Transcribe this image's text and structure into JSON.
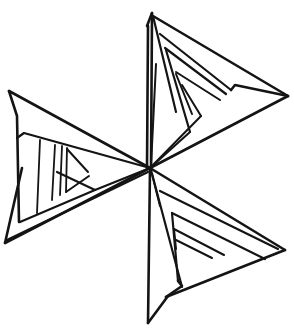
{
  "document": {
    "title": "Pinwheel Star Line Drawing",
    "kind": "line-drawing",
    "description": "Hand-drawn six-bladed pinwheel star composed of thin triangular blades radiating from a common center point, each blade filled with nested parallel line detail.",
    "width": 294,
    "height": 336
  },
  "style": {
    "background_color": "#ffffff",
    "stroke_color": "#141414",
    "stroke_width_outer": 2.6,
    "stroke_width_inner": 2.0
  },
  "figure": {
    "name": "pinwheel-star",
    "center": {
      "x": 150,
      "y": 168
    },
    "blade_count": 6,
    "tips": [
      {
        "name": "top-tip",
        "x": 152,
        "y": 13
      },
      {
        "name": "upper-right-tip",
        "x": 288,
        "y": 96
      },
      {
        "name": "lower-right-tip",
        "x": 285,
        "y": 250
      },
      {
        "name": "bottom-tip",
        "x": 148,
        "y": 323
      },
      {
        "name": "lower-left-tip",
        "x": 5,
        "y": 243
      },
      {
        "name": "upper-left-tip",
        "x": 9,
        "y": 91
      }
    ],
    "blades": [
      {
        "name": "blade-top",
        "label": "Top spike",
        "outline": "152,13 150,168 147,168 148,30",
        "detail_lines": [
          "152,13 172,168",
          "155,60 150,168"
        ]
      },
      {
        "name": "blade-upper-right",
        "label": "Upper-right blade",
        "outline": "153,16 288,96 234,86 150,168",
        "detail_lines": [
          "160,32 275,92",
          "171,57 233,87",
          "176,70 221,99",
          "182,83 204,110"
        ]
      },
      {
        "name": "blade-lower-right",
        "label": "Lower-right blade",
        "outline": "150,168 285,250 230,249 165,300",
        "detail_lines": [
          "160,190 275,249",
          "172,223 230,250",
          "177,236 214,251",
          "183,249 201,255"
        ]
      },
      {
        "name": "blade-bottom",
        "label": "Bottom spike",
        "outline": "150,168 153,168 152,320 148,323",
        "detail_lines": [
          "150,168 176,302",
          "150,168 160,290"
        ]
      },
      {
        "name": "blade-lower-left",
        "label": "Lower-left blade",
        "outline": "150,168 5,243 22,168",
        "detail_lines": [
          "5,243 145,172",
          "20,205 96,186"
        ]
      },
      {
        "name": "blade-upper-left",
        "label": "Upper-left blade",
        "outline": "9,91 150,168 20,141 18,115",
        "detail_lines": [
          "9,91 18,222",
          "18,137 150,168",
          "40,141 36,212",
          "55,145 52,200",
          "62,146 60,195",
          "66,147 65,193"
        ]
      }
    ]
  }
}
